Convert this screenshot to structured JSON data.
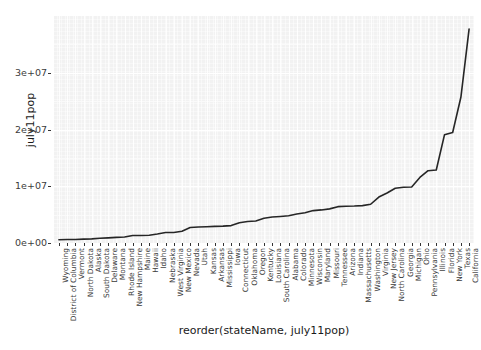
{
  "chart_data": {
    "type": "line",
    "title": "",
    "xlabel": "reorder(stateName, july11pop)",
    "ylabel": "july11pop",
    "ylim": [
      0,
      40000000
    ],
    "ytick_labels": [
      "0e+00",
      "1e+07",
      "2e+07",
      "3e+07"
    ],
    "ytick_values": [
      0,
      10000000,
      20000000,
      30000000
    ],
    "grid": true,
    "legend": "none",
    "categories": [
      "Wyoming",
      "District of Columbia",
      "Vermont",
      "North Dakota",
      "Alaska",
      "South Dakota",
      "Delaware",
      "Montana",
      "Rhode Island",
      "New Hampshire",
      "Maine",
      "Hawaii",
      "Idaho",
      "Nebraska",
      "West Virginia",
      "New Mexico",
      "Nevada",
      "Utah",
      "Kansas",
      "Arkansas",
      "Mississippi",
      "Iowa",
      "Connecticut",
      "Oklahoma",
      "Oregon",
      "Kentucky",
      "Louisiana",
      "South Carolina",
      "Alabama",
      "Colorado",
      "Minnesota",
      "Wisconsin",
      "Maryland",
      "Missouri",
      "Tennessee",
      "Arizona",
      "Indiana",
      "Massachusetts",
      "Washington",
      "Virginia",
      "New Jersey",
      "North Carolina",
      "Georgia",
      "Michigan",
      "Ohio",
      "Pennsylvania",
      "Illinois",
      "Florida",
      "New York",
      "Texas",
      "California"
    ],
    "values": [
      568158,
      617996,
      626431,
      683932,
      722718,
      824082,
      907135,
      998199,
      1051302,
      1318194,
      1328188,
      1374810,
      1584985,
      1842641,
      1855364,
      2082224,
      2723322,
      2817222,
      2871238,
      2937979,
      2978512,
      3062309,
      3580709,
      3791508,
      3871859,
      4369356,
      4574836,
      4679230,
      4802740,
      5116796,
      5344861,
      5711767,
      5828289,
      6010688,
      6403353,
      6482505,
      6516922,
      6587536,
      6830038,
      8096604,
      8821155,
      9656401,
      9815210,
      9876187,
      11544951,
      12742886,
      12869257,
      19057542,
      19465197,
      25674681,
      37691912
    ]
  },
  "axes": {
    "y_title": "july11pop",
    "x_title": "reorder(stateName, july11pop)"
  }
}
